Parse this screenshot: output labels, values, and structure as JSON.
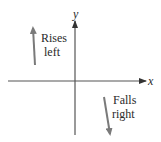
{
  "diagram": {
    "type": "end-behavior-sketch",
    "axes": {
      "x_label": "x",
      "y_label": "y",
      "color": "#555555",
      "origin": [
        75,
        81
      ]
    },
    "annotations": [
      {
        "id": "rises-left",
        "line1": "Rises",
        "line2": "left",
        "direction": "up",
        "arrow_color": "#888888"
      },
      {
        "id": "falls-right",
        "line1": "Falls",
        "line2": "right",
        "direction": "down",
        "arrow_color": "#888888"
      }
    ],
    "text_color": "#2a2a2a",
    "background": "#ffffff"
  }
}
